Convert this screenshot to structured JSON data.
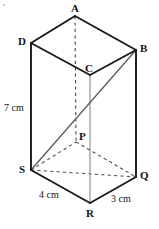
{
  "figure": {
    "shape_type": "rectangular prism",
    "projection": "oblique",
    "stroke_color_solid": "#1a1a1a",
    "stroke_color_hidden": "#4a4a4a",
    "stroke_color_thin": "#8a8a8a",
    "background_color": "#ffffff",
    "vertices": [
      {
        "id": "A",
        "label": "A",
        "x": 75,
        "y": 16,
        "label_x": 71,
        "label_y": 3,
        "hidden": false
      },
      {
        "id": "B",
        "label": "B",
        "x": 136,
        "y": 50,
        "label_x": 140,
        "label_y": 43,
        "hidden": false
      },
      {
        "id": "C",
        "label": "C",
        "x": 90,
        "y": 75,
        "label_x": 85,
        "label_y": 63,
        "hidden": false
      },
      {
        "id": "D",
        "label": "D",
        "x": 31,
        "y": 43,
        "label_x": 18,
        "label_y": 36,
        "hidden": false
      },
      {
        "id": "P",
        "label": "P",
        "x": 76,
        "y": 142,
        "label_x": 79,
        "label_y": 131,
        "hidden": true
      },
      {
        "id": "Q",
        "label": "Q",
        "x": 136,
        "y": 177,
        "label_x": 140,
        "label_y": 170,
        "hidden": false
      },
      {
        "id": "R",
        "label": "R",
        "x": 90,
        "y": 203,
        "label_x": 86,
        "label_y": 208,
        "hidden": false
      },
      {
        "id": "S",
        "label": "S",
        "x": 31,
        "y": 170,
        "label_x": 19,
        "label_y": 164,
        "hidden": false
      }
    ],
    "edges": [
      {
        "name": "edge-D-A",
        "from": "D",
        "to": "A",
        "style": "solid",
        "weight": 1.9,
        "color": "#1a1a1a"
      },
      {
        "name": "edge-A-B",
        "from": "A",
        "to": "B",
        "style": "solid",
        "weight": 1.9,
        "color": "#1a1a1a"
      },
      {
        "name": "edge-B-C",
        "from": "B",
        "to": "C",
        "style": "solid",
        "weight": 1.9,
        "color": "#1a1a1a"
      },
      {
        "name": "edge-C-D",
        "from": "C",
        "to": "D",
        "style": "solid",
        "weight": 1.9,
        "color": "#1a1a1a"
      },
      {
        "name": "edge-D-S",
        "from": "D",
        "to": "S",
        "style": "solid",
        "weight": 1.9,
        "color": "#1a1a1a"
      },
      {
        "name": "edge-B-Q",
        "from": "B",
        "to": "Q",
        "style": "solid",
        "weight": 1.9,
        "color": "#1a1a1a"
      },
      {
        "name": "edge-C-R",
        "from": "C",
        "to": "R",
        "style": "solid",
        "weight": 1.1,
        "color": "#8a8a8a"
      },
      {
        "name": "edge-A-P",
        "from": "A",
        "to": "P",
        "style": "dashed",
        "weight": 1.1,
        "color": "#4a4a4a"
      },
      {
        "name": "edge-S-R",
        "from": "S",
        "to": "R",
        "style": "solid",
        "weight": 1.9,
        "color": "#1a1a1a"
      },
      {
        "name": "edge-R-Q",
        "from": "R",
        "to": "Q",
        "style": "solid",
        "weight": 1.9,
        "color": "#1a1a1a"
      },
      {
        "name": "edge-S-P",
        "from": "S",
        "to": "P",
        "style": "dashed",
        "weight": 1.1,
        "color": "#4a4a4a"
      },
      {
        "name": "edge-P-Q",
        "from": "P",
        "to": "Q",
        "style": "dashed",
        "weight": 1.1,
        "color": "#4a4a4a"
      },
      {
        "name": "diagonal-S-Q",
        "from": "S",
        "to": "Q",
        "style": "dashed",
        "weight": 1.0,
        "color": "#4a4a4a"
      },
      {
        "name": "diagonal-B-S",
        "from": "B",
        "to": "S",
        "style": "solid",
        "weight": 1.3,
        "color": "#5a5a5a"
      }
    ],
    "dimension_labels": [
      {
        "name": "height-label",
        "text": "7 cm",
        "x": 4,
        "y": 103,
        "edge": "edge-D-S"
      },
      {
        "name": "base-width-label",
        "text": "4 cm",
        "x": 39,
        "y": 190,
        "edge": "edge-S-R"
      },
      {
        "name": "base-depth-label",
        "text": "3 cm",
        "x": 111,
        "y": 194,
        "edge": "edge-R-Q"
      }
    ],
    "artifacts": [
      {
        "name": "scan-speck-top-left",
        "x": 3,
        "y": 4
      }
    ]
  }
}
